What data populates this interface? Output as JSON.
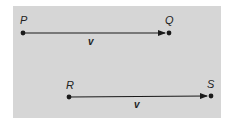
{
  "diagram": {
    "background_color": "#d6d6d6",
    "line_color": "#1a1a1a",
    "vectors": [
      {
        "from": {
          "label": "P",
          "x": 23,
          "y": 33
        },
        "to": {
          "label": "Q",
          "x": 169,
          "y": 33
        },
        "label": "v"
      },
      {
        "from": {
          "label": "R",
          "x": 69,
          "y": 97
        },
        "to": {
          "label": "S",
          "x": 211,
          "y": 96
        },
        "label": "v"
      }
    ]
  }
}
